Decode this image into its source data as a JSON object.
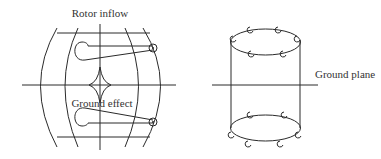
{
  "diagrams": {
    "left": {
      "title": "Rotor inflow",
      "annotation": "Ground effect"
    },
    "right": {
      "annotation": "Ground plane"
    }
  },
  "colors": {
    "stroke": "#2a2a2a",
    "text": "#333333",
    "background": "#ffffff"
  }
}
